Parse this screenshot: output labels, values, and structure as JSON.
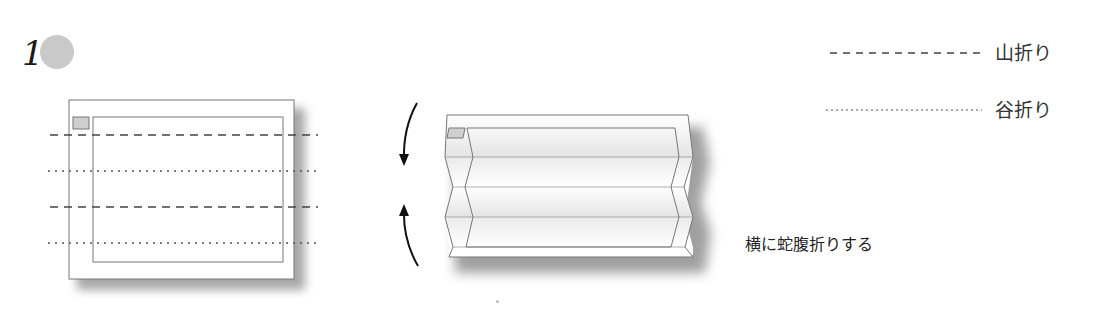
{
  "step": {
    "number": "1"
  },
  "legend": {
    "items": [
      {
        "line_style": "dashed",
        "label": "山折り",
        "meaning": "mountain-fold"
      },
      {
        "line_style": "dotted",
        "label": "谷折り",
        "meaning": "valley-fold"
      }
    ]
  },
  "diagram": {
    "flat_sheet": {
      "fold_lines": [
        {
          "style": "dashed",
          "label": "mountain-fold"
        },
        {
          "style": "dotted",
          "label": "valley-fold"
        },
        {
          "style": "dashed",
          "label": "mountain-fold"
        },
        {
          "style": "dotted",
          "label": "valley-fold"
        }
      ]
    },
    "arrows": [
      {
        "direction": "down"
      },
      {
        "direction": "up"
      }
    ],
    "folded_sheet": {
      "shape": "accordion-fold"
    }
  },
  "caption": "横に蛇腹折りする",
  "colors": {
    "line": "#555555",
    "sheet": "#ffffff",
    "shadow": "#9a9a9a",
    "marker_fill": "#cfcfcf",
    "step_circle": "#c9c9c9"
  }
}
